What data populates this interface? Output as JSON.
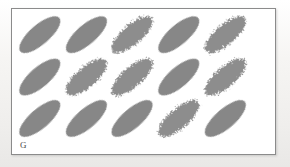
{
  "figure": {
    "label": "G",
    "label_name": "panel-label-g",
    "caption_visible": false,
    "panel": {
      "background_color": "#ffffff",
      "border_color": "#8b8b8b",
      "border_width_px": 1,
      "x": 11,
      "y": 8,
      "width": 265,
      "height": 147
    },
    "page_background_color": "#f1f0ee"
  },
  "chart_data": {
    "type": "scatter",
    "title": "",
    "subtitle": "",
    "xlabel": "",
    "ylabel": "",
    "grid": false,
    "legend": "none",
    "element_shape": "ellipse",
    "element_fill_color": "#8a8a8a",
    "element_edge_smooth_color": "#878787",
    "element_edge_rough_color": "#8d8d8d",
    "element_tilt_degrees": -41,
    "element_semi_major_px": 26,
    "element_semi_minor_px": 10,
    "rows": 3,
    "columns": 5,
    "count": 15,
    "column_centers_x": [
      40,
      87,
      133,
      180,
      227
    ],
    "row_centers_y": [
      35,
      78,
      120
    ],
    "edge_types": [
      "smooth",
      "rough"
    ],
    "elements": [
      {
        "id": 1,
        "row": 1,
        "col": 1,
        "cx": 40,
        "cy": 35,
        "rx": 26,
        "ry": 10,
        "tilt": -41,
        "edge": "smooth"
      },
      {
        "id": 2,
        "row": 1,
        "col": 2,
        "cx": 87,
        "cy": 35,
        "rx": 26,
        "ry": 10,
        "tilt": -41,
        "edge": "smooth"
      },
      {
        "id": 3,
        "row": 1,
        "col": 3,
        "cx": 133,
        "cy": 35,
        "rx": 26,
        "ry": 10,
        "tilt": -41,
        "edge": "rough"
      },
      {
        "id": 4,
        "row": 1,
        "col": 4,
        "cx": 180,
        "cy": 35,
        "rx": 26,
        "ry": 10,
        "tilt": -41,
        "edge": "smooth"
      },
      {
        "id": 5,
        "row": 1,
        "col": 5,
        "cx": 227,
        "cy": 35,
        "rx": 26,
        "ry": 10,
        "tilt": -41,
        "edge": "rough"
      },
      {
        "id": 6,
        "row": 2,
        "col": 1,
        "cx": 40,
        "cy": 78,
        "rx": 26,
        "ry": 10,
        "tilt": -41,
        "edge": "smooth"
      },
      {
        "id": 7,
        "row": 2,
        "col": 2,
        "cx": 87,
        "cy": 78,
        "rx": 26,
        "ry": 10,
        "tilt": -41,
        "edge": "rough"
      },
      {
        "id": 8,
        "row": 2,
        "col": 3,
        "cx": 133,
        "cy": 78,
        "rx": 26,
        "ry": 10,
        "tilt": -41,
        "edge": "rough"
      },
      {
        "id": 9,
        "row": 2,
        "col": 4,
        "cx": 180,
        "cy": 78,
        "rx": 26,
        "ry": 10,
        "tilt": -41,
        "edge": "smooth"
      },
      {
        "id": 10,
        "row": 2,
        "col": 5,
        "cx": 227,
        "cy": 78,
        "rx": 26,
        "ry": 10,
        "tilt": -41,
        "edge": "rough"
      },
      {
        "id": 11,
        "row": 3,
        "col": 1,
        "cx": 40,
        "cy": 120,
        "rx": 26,
        "ry": 10,
        "tilt": -41,
        "edge": "smooth"
      },
      {
        "id": 12,
        "row": 3,
        "col": 2,
        "cx": 87,
        "cy": 120,
        "rx": 26,
        "ry": 10,
        "tilt": -41,
        "edge": "smooth"
      },
      {
        "id": 13,
        "row": 3,
        "col": 3,
        "cx": 133,
        "cy": 120,
        "rx": 26,
        "ry": 10,
        "tilt": -41,
        "edge": "smooth"
      },
      {
        "id": 14,
        "row": 3,
        "col": 4,
        "cx": 180,
        "cy": 120,
        "rx": 26,
        "ry": 10,
        "tilt": -41,
        "edge": "rough"
      },
      {
        "id": 15,
        "row": 3,
        "col": 5,
        "cx": 227,
        "cy": 120,
        "rx": 26,
        "ry": 10,
        "tilt": -41,
        "edge": "smooth"
      }
    ]
  }
}
